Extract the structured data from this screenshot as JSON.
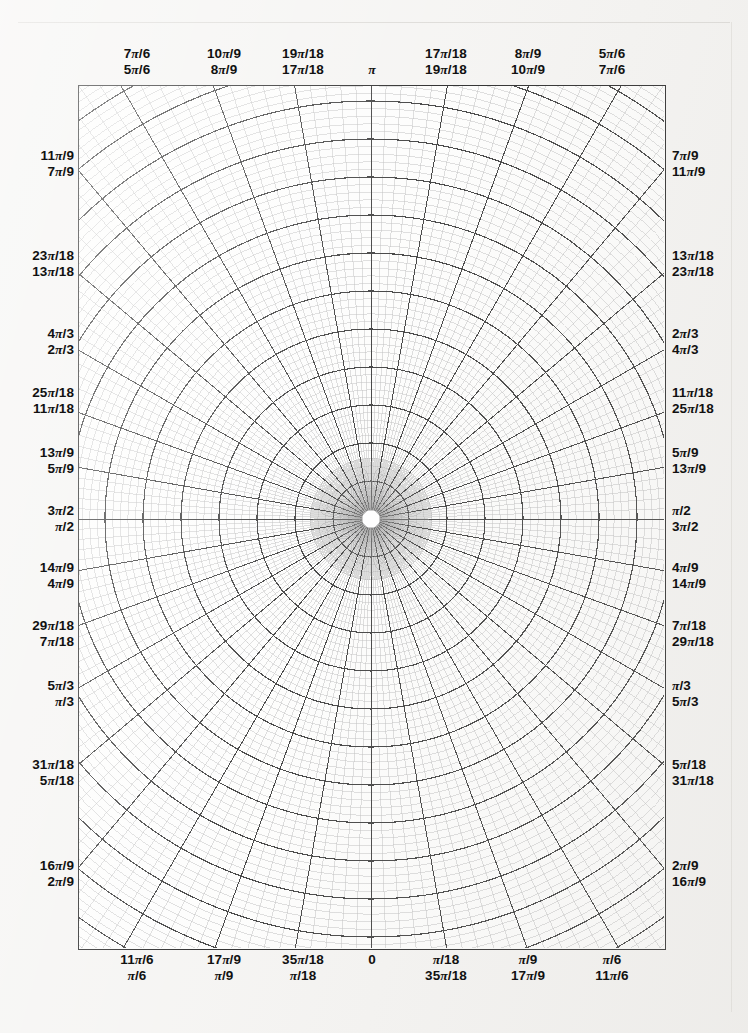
{
  "document": {
    "kind": "polar-graph-paper",
    "title": "Polar coordinate graph paper"
  },
  "plot": {
    "center": {
      "x": 292,
      "y": 433
    },
    "angular": {
      "major_step_label": "pi/18",
      "major_divisions": 36,
      "minor_per_major": 5
    },
    "radial": {
      "major_rings": 12,
      "minor_per_major": 5,
      "inner_blank_radius": 9
    }
  },
  "axis_labels": {
    "top": [
      {
        "upper": "7π/6",
        "lower": "5π/6",
        "x": 137
      },
      {
        "upper": "10π/9",
        "lower": "8π/9",
        "x": 224
      },
      {
        "upper": "19π/18",
        "lower": "17π/18",
        "x": 303
      },
      {
        "upper": "",
        "lower": "π",
        "x": 372
      },
      {
        "upper": "17π/18",
        "lower": "19π/18",
        "x": 446
      },
      {
        "upper": "8π/9",
        "lower": "10π/9",
        "x": 528
      },
      {
        "upper": "5π/6",
        "lower": "7π/6",
        "x": 612
      }
    ],
    "bottom": [
      {
        "upper": "11π/6",
        "lower": "π/6",
        "x": 137
      },
      {
        "upper": "17π/9",
        "lower": "π/9",
        "x": 224
      },
      {
        "upper": "35π/18",
        "lower": "π/18",
        "x": 303
      },
      {
        "upper": "0",
        "lower": "",
        "x": 372
      },
      {
        "upper": "π/18",
        "lower": "35π/18",
        "x": 446
      },
      {
        "upper": "π/9",
        "lower": "17π/9",
        "x": 528
      },
      {
        "upper": "π/6",
        "lower": "11π/6",
        "x": 612
      }
    ],
    "left": [
      {
        "upper": "11π/9",
        "lower": "7π/9",
        "y": 163
      },
      {
        "upper": "23π/18",
        "lower": "13π/18",
        "y": 263
      },
      {
        "upper": "4π/3",
        "lower": "2π/3",
        "y": 341
      },
      {
        "upper": "25π/18",
        "lower": "11π/18",
        "y": 400
      },
      {
        "upper": "13π/9",
        "lower": "5π/9",
        "y": 460
      },
      {
        "upper": "3π/2",
        "lower": "π/2",
        "y": 518
      },
      {
        "upper": "14π/9",
        "lower": "4π/9",
        "y": 575
      },
      {
        "upper": "29π/18",
        "lower": "7π/18",
        "y": 633
      },
      {
        "upper": "5π/3",
        "lower": "π/3",
        "y": 693
      },
      {
        "upper": "31π/18",
        "lower": "5π/18",
        "y": 772
      },
      {
        "upper": "16π/9",
        "lower": "2π/9",
        "y": 873
      }
    ],
    "right": [
      {
        "upper": "7π/9",
        "lower": "11π/9",
        "y": 163
      },
      {
        "upper": "13π/18",
        "lower": "23π/18",
        "y": 263
      },
      {
        "upper": "2π/3",
        "lower": "4π/3",
        "y": 341
      },
      {
        "upper": "11π/18",
        "lower": "25π/18",
        "y": 400
      },
      {
        "upper": "5π/9",
        "lower": "13π/9",
        "y": 460
      },
      {
        "upper": "π/2",
        "lower": "3π/2",
        "y": 518
      },
      {
        "upper": "4π/9",
        "lower": "14π/9",
        "y": 575
      },
      {
        "upper": "7π/18",
        "lower": "29π/18",
        "y": 633
      },
      {
        "upper": "π/3",
        "lower": "5π/3",
        "y": 693
      },
      {
        "upper": "5π/18",
        "lower": "31π/18",
        "y": 772
      },
      {
        "upper": "2π/9",
        "lower": "16π/9",
        "y": 873
      }
    ]
  },
  "colors": {
    "paper": "#f4f3f1",
    "plot_background": "#fdfdfc",
    "ink": "#111111",
    "grid_major": "#2a2a2a",
    "grid_minor": "#8e8e8e",
    "grid_fine": "#b8b8b8"
  }
}
